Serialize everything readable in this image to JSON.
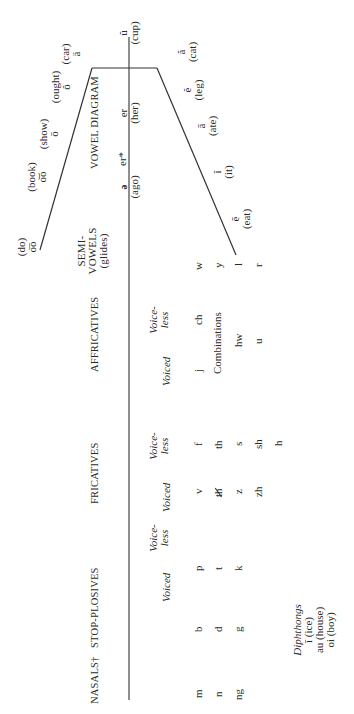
{
  "headers": {
    "nasals": "NASALS†",
    "stop_plosives": "STOP-PLOSIVES",
    "fricatives": "FRICATIVES",
    "affricatives": "AFFRICATIVES",
    "semivowels_1": "SEMI-",
    "semivowels_2": "VOWELS",
    "semivowels_3": "(glides)",
    "vowel_diagram": "VOWEL DIAGRAM"
  },
  "subheaders": {
    "voiced": "Voiced",
    "voiceless_1": "Voice-",
    "voiceless_2": "less"
  },
  "nasals": [
    "m",
    "n",
    "ng"
  ],
  "stop_plosives": {
    "voiced": [
      "b",
      "d",
      "g"
    ],
    "voiceless": [
      "p",
      "t",
      "k"
    ]
  },
  "fricatives": {
    "voiced": [
      "v",
      "th",
      "z",
      "zh"
    ],
    "voiceless": [
      "f",
      "th",
      "s",
      "sh",
      "h"
    ]
  },
  "affricatives": {
    "voiced": [
      "j"
    ],
    "voiceless": [
      "ch"
    ],
    "combinations_label": "Combinations",
    "combinations": [
      "hw",
      "u"
    ]
  },
  "semivowels": [
    "w",
    "y",
    "l",
    "r"
  ],
  "diphthongs": {
    "title": "Diphthongs",
    "items": [
      "ī (ice)",
      "au (house)",
      "oi (boy)"
    ]
  },
  "vowels": {
    "back": [
      {
        "symbol": "o͞o",
        "word": "(do)"
      },
      {
        "symbol": "o͝o",
        "word": "(book)"
      },
      {
        "symbol": "ō",
        "word": "(show)"
      },
      {
        "symbol": "ô",
        "word": "(ought)"
      },
      {
        "symbol": "ä",
        "word": "(car)"
      }
    ],
    "central": [
      {
        "symbol": "ə",
        "word": "(ago)"
      },
      {
        "symbol": "er*",
        "word": ""
      },
      {
        "symbol": "er",
        "word": "(her)"
      },
      {
        "symbol": "ŭ",
        "word": "(cup)"
      }
    ],
    "front": [
      {
        "symbol": "ē",
        "word": "(eat)"
      },
      {
        "symbol": "ĭ",
        "word": "(it)"
      },
      {
        "symbol": "ā",
        "word": "(ate)"
      },
      {
        "symbol": "ĕ",
        "word": "(leg)"
      },
      {
        "symbol": "ă",
        "word": "(cat)"
      }
    ]
  }
}
